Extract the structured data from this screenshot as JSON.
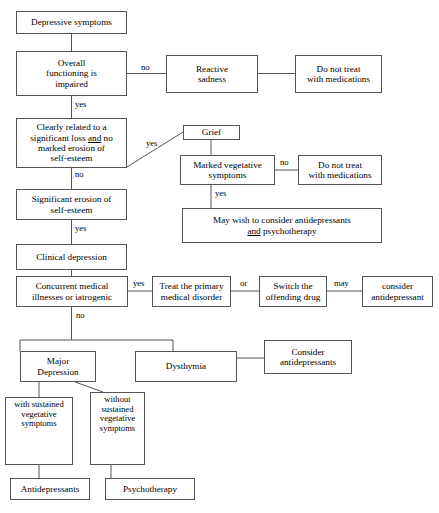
{
  "diagram": {
    "type": "flowchart",
    "width": 439,
    "height": 513,
    "line_color": "#555555",
    "background": "#ffffff",
    "text_color": "#000000"
  },
  "nodes": {
    "depressive_symptoms": "Depressive symptoms",
    "overall_functioning": "Overall\nfunctioning is\nimpaired",
    "reactive_sadness": "Reactive\nsadness",
    "do_not_treat_1": "Do not treat\nwith medications",
    "clearly_related": "Clearly related to a\nsignificant loss and no\nmarked erosion of\nself-esteem",
    "grief": "Grief",
    "marked_vegetative": "Marked vegetative\nsymptoms",
    "do_not_treat_2": "Do not treat\nwith medications",
    "may_wish": "May wish to consider antidepressants\nand psychotherapy",
    "significant_erosion": "Significant erosion of\nself-esteem",
    "clinical_depression": "Clinical depression",
    "concurrent_medical": "Concurrent medical\nillnesses or iatrogenic",
    "treat_primary": "Treat the primary\nmedical disorder",
    "switch_drug": "Switch the\noffending drug",
    "consider_antidepressant": "consider\nantidepressant",
    "major_depression": "Major\nDepression",
    "dysthymia": "Dysthymia",
    "consider_antidepressants": "Consider\nantidepressants",
    "with_sustained": "with sustained\nvegetative\nsymptoms",
    "without_sustained": "without\nsustained\nvegetative\nsymptoms",
    "antidepressants": "Antidepressants",
    "psychotherapy": "Psychotherapy"
  },
  "edge_labels": {
    "functioning_no": "no",
    "functioning_yes": "yes",
    "clearly_related_yes": "yes",
    "clearly_related_no": "no",
    "vegetative_no": "no",
    "vegetative_yes": "yes",
    "erosion_yes": "yes",
    "concurrent_yes": "yes",
    "concurrent_no": "no",
    "or": "or",
    "may": "may"
  }
}
